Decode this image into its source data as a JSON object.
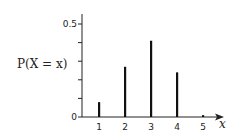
{
  "chart_data": {
    "type": "bar",
    "title": "",
    "xlabel": "x",
    "ylabel": "P(X = x)",
    "categories": [
      "1",
      "2",
      "3",
      "4",
      "5"
    ],
    "x": [
      1,
      2,
      3,
      4,
      5
    ],
    "values": [
      0.08,
      0.27,
      0.41,
      0.24,
      0.01
    ],
    "ylim": [
      0,
      0.5
    ],
    "yticks": [
      0,
      0.1,
      0.2,
      0.3,
      0.4,
      0.5
    ],
    "ytick_labels": [
      "0",
      "",
      "",
      "",
      "",
      "0.5"
    ],
    "grid": false,
    "legend": null,
    "bar_style": "thin vertical lines",
    "color": "#111111"
  }
}
